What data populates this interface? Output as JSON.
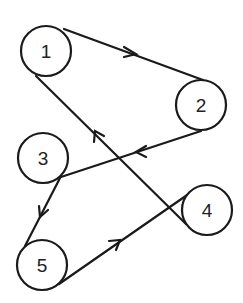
{
  "nodes": [
    {
      "id": "1",
      "label": "1",
      "cx": 46,
      "cy": 51
    },
    {
      "id": "2",
      "label": "2",
      "cx": 201,
      "cy": 105
    },
    {
      "id": "3",
      "label": "3",
      "cx": 43,
      "cy": 158
    },
    {
      "id": "4",
      "label": "4",
      "cx": 206,
      "cy": 210
    },
    {
      "id": "5",
      "label": "5",
      "cx": 42,
      "cy": 265
    }
  ],
  "edges": [
    {
      "from": "1",
      "to": "2"
    },
    {
      "from": "2",
      "to": "3"
    },
    {
      "from": "3",
      "to": "5"
    },
    {
      "from": "5",
      "to": "4"
    },
    {
      "from": "4",
      "to": "1"
    }
  ],
  "colors": {
    "stroke": "#1a1a1a",
    "fill": "#ffffff"
  }
}
